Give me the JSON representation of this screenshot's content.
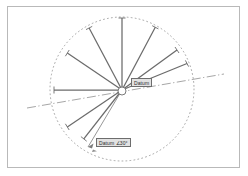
{
  "diagram": {
    "background_color": "#ffffff",
    "frame_color": "#b9b9b9",
    "line_color": "#6b6b6b",
    "construction_color": "#9a9a9a",
    "label_fill": "#e2e2e2",
    "label_border": "#6d6d6d",
    "label_text_color": "#2b2b2b"
  },
  "labels": {
    "datum": "Datum",
    "datum_angle": "Datum  ∠30°"
  },
  "center": {
    "x": 122,
    "y": 90,
    "hub_radius": 4
  },
  "reference_circle": {
    "style": "dotted",
    "center_x": 122,
    "center_y": 89,
    "radius": 72
  },
  "datum_axis": {
    "style": "dash-dot",
    "x1": 27,
    "y1": 108,
    "x2": 224,
    "y2": 74
  },
  "spokes": [
    {
      "name": "spoke-0",
      "angle_deg": 90,
      "length": 72,
      "tick": true
    },
    {
      "name": "spoke-1",
      "angle_deg": 62,
      "length": 71,
      "tick": true
    },
    {
      "name": "spoke-2",
      "angle_deg": 36,
      "length": 68,
      "tick": true
    },
    {
      "name": "spoke-3",
      "angle_deg": 118,
      "length": 70,
      "tick": true
    },
    {
      "name": "spoke-4",
      "angle_deg": 146,
      "length": 66,
      "tick": true
    },
    {
      "name": "spoke-5",
      "angle_deg": 180,
      "length": 68,
      "tick": true
    },
    {
      "name": "spoke-6",
      "angle_deg": 214,
      "length": 66,
      "tick": true
    },
    {
      "name": "spoke-7",
      "angle_deg": 232,
      "length": 62,
      "tick": true
    },
    {
      "name": "spoke-8",
      "angle_deg": 256,
      "length": 60,
      "tick": true
    }
  ],
  "callout_leaders": [
    {
      "name": "leader-datum-angle",
      "x1": 122,
      "y1": 90,
      "x2": 88,
      "y2": 147
    }
  ]
}
